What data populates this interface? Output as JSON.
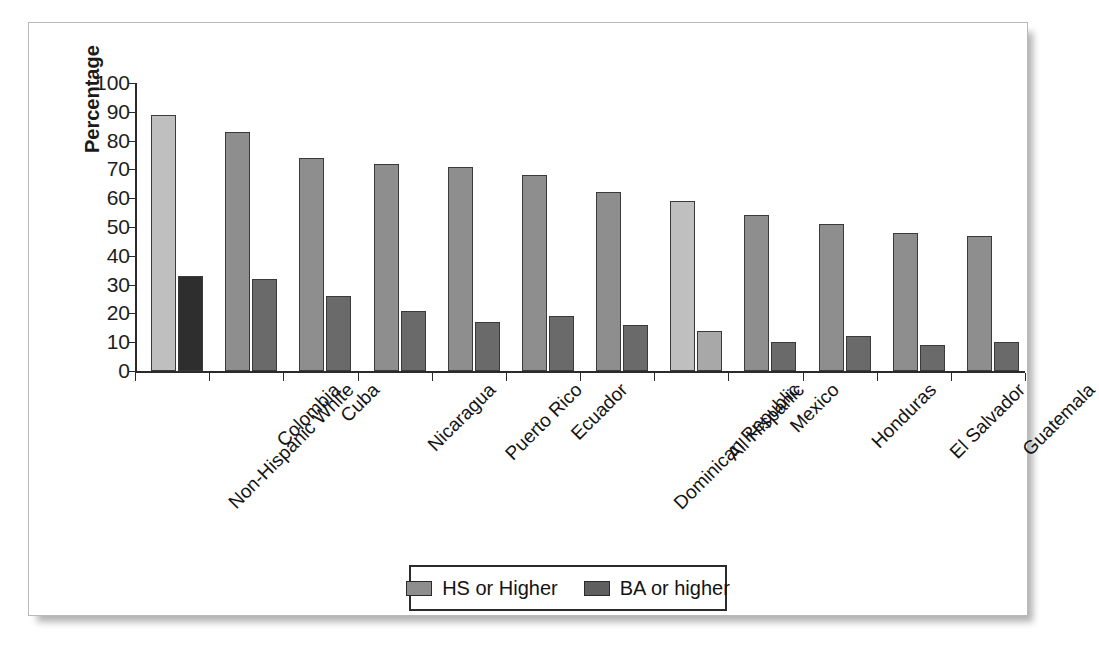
{
  "chart_data": {
    "type": "bar",
    "title": "",
    "xlabel": "",
    "ylabel": "Percentage",
    "ylim": [
      0,
      100
    ],
    "ytick_labels": [
      "100",
      "90",
      "80",
      "70",
      "60",
      "50",
      "40",
      "30",
      "20",
      "10",
      "0"
    ],
    "yticks": [
      100,
      90,
      80,
      70,
      60,
      50,
      40,
      30,
      20,
      10,
      0
    ],
    "grid": false,
    "legend_position": "bottom-center",
    "categories": [
      "Non-Hispanic White",
      "Colombia",
      "Cuba",
      "Nicaragua",
      "Puerto Rico",
      "Ecuador",
      "Dominican Republic",
      "All Hispanic",
      "Mexico",
      "Honduras",
      "El Salvador",
      "Guatemala"
    ],
    "series": [
      {
        "name": "HS or Higher",
        "color": "#8e8e8e",
        "values": [
          89,
          83,
          74,
          72,
          71,
          68,
          62,
          59,
          54,
          51,
          48,
          47
        ]
      },
      {
        "name": "BA or higher",
        "color": "#5f5f5f",
        "values": [
          33,
          32,
          26,
          21,
          17,
          19,
          16,
          14,
          10,
          12,
          9,
          10
        ]
      }
    ],
    "highlighted_categories": [
      "Non-Hispanic White",
      "All Hispanic"
    ]
  },
  "legend": {
    "items": [
      {
        "label": "HS or Higher",
        "swatch": "legend-swatch-hs"
      },
      {
        "label": "BA or higher",
        "swatch": "legend-swatch-ba"
      }
    ]
  }
}
